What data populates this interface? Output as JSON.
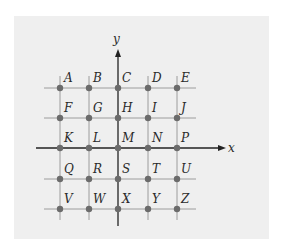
{
  "diagram": {
    "x_axis_label": "x",
    "y_axis_label": "y",
    "columns_px": [
      60,
      89,
      118,
      148,
      177
    ],
    "rows_px": [
      88,
      118,
      148,
      179,
      209
    ],
    "points": [
      [
        "A",
        "B",
        "C",
        "D",
        "E"
      ],
      [
        "F",
        "G",
        "H",
        "I",
        "J"
      ],
      [
        "K",
        "L",
        "M",
        "N",
        "P"
      ],
      [
        "Q",
        "R",
        "S",
        "T",
        "U"
      ],
      [
        "V",
        "W",
        "X",
        "Y",
        "Z"
      ]
    ],
    "colors": {
      "panel": "#efefef",
      "grid": "#9c9c9c",
      "axis": "#222222",
      "point": "#6b6b6b",
      "label": "#2a2a2a"
    }
  }
}
